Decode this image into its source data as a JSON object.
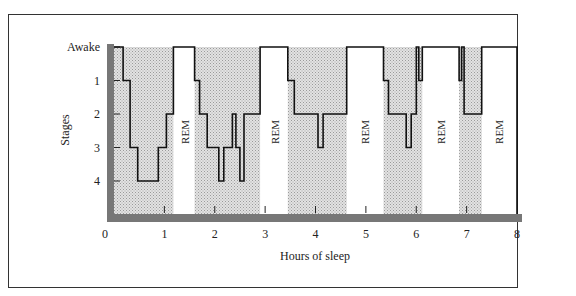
{
  "chart_data": {
    "type": "line",
    "subtype": "step",
    "title": "",
    "xlabel": "Hours of sleep",
    "ylabel": "Stages",
    "xlim": [
      0,
      8
    ],
    "x_ticks": [
      "0",
      "1",
      "2",
      "3",
      "4",
      "5",
      "6",
      "7",
      "8"
    ],
    "y_ticks": [
      "Awake",
      "1",
      "2",
      "3",
      "4"
    ],
    "y_encoding": {
      "Awake": 0,
      "1": 1,
      "2": 2,
      "3": 3,
      "4": 4
    },
    "series": [
      {
        "name": "Sleep stage",
        "points": [
          [
            0.18,
            0
          ],
          [
            0.18,
            1
          ],
          [
            0.32,
            1
          ],
          [
            0.32,
            3
          ],
          [
            0.47,
            3
          ],
          [
            0.47,
            4
          ],
          [
            0.88,
            4
          ],
          [
            0.88,
            3
          ],
          [
            1.04,
            3
          ],
          [
            1.04,
            2
          ],
          [
            1.18,
            2
          ],
          [
            1.18,
            0
          ],
          [
            1.6,
            0
          ],
          [
            1.6,
            1
          ],
          [
            1.7,
            1
          ],
          [
            1.7,
            2
          ],
          [
            1.85,
            2
          ],
          [
            1.85,
            3
          ],
          [
            2.08,
            3
          ],
          [
            2.08,
            4
          ],
          [
            2.18,
            4
          ],
          [
            2.18,
            3
          ],
          [
            2.35,
            3
          ],
          [
            2.35,
            2
          ],
          [
            2.42,
            2
          ],
          [
            2.42,
            3
          ],
          [
            2.5,
            3
          ],
          [
            2.5,
            4
          ],
          [
            2.58,
            4
          ],
          [
            2.58,
            2
          ],
          [
            2.9,
            2
          ],
          [
            2.9,
            0
          ],
          [
            3.45,
            0
          ],
          [
            3.45,
            1
          ],
          [
            3.58,
            1
          ],
          [
            3.58,
            2
          ],
          [
            4.05,
            2
          ],
          [
            4.05,
            3
          ],
          [
            4.15,
            3
          ],
          [
            4.15,
            2
          ],
          [
            4.62,
            2
          ],
          [
            4.62,
            0
          ],
          [
            5.35,
            0
          ],
          [
            5.35,
            1
          ],
          [
            5.45,
            1
          ],
          [
            5.45,
            2
          ],
          [
            5.8,
            2
          ],
          [
            5.8,
            3
          ],
          [
            5.9,
            3
          ],
          [
            5.9,
            2
          ],
          [
            6.0,
            2
          ],
          [
            6.0,
            0
          ],
          [
            6.05,
            0
          ],
          [
            6.05,
            1
          ],
          [
            6.12,
            1
          ],
          [
            6.12,
            0
          ],
          [
            6.85,
            0
          ],
          [
            6.85,
            1
          ],
          [
            6.9,
            1
          ],
          [
            6.9,
            0
          ],
          [
            6.95,
            0
          ],
          [
            6.95,
            2
          ],
          [
            7.3,
            2
          ],
          [
            7.3,
            0
          ],
          [
            8.0,
            0
          ],
          [
            8.0,
            5
          ]
        ]
      }
    ],
    "shaded_regions": [
      [
        0,
        1.18
      ],
      [
        1.6,
        2.9
      ],
      [
        3.45,
        4.62
      ],
      [
        5.35,
        6.12
      ],
      [
        6.85,
        7.3
      ]
    ],
    "annotations": [
      {
        "text": "REM",
        "x": 1.4
      },
      {
        "text": "REM",
        "x": 3.2
      },
      {
        "text": "REM",
        "x": 4.98
      },
      {
        "text": "REM",
        "x": 6.5
      },
      {
        "text": "REM",
        "x": 7.65
      }
    ],
    "grid": false,
    "legend": null
  },
  "labels": {
    "xlabel": "Hours of sleep",
    "ylabel": "Stages",
    "rem": "REM",
    "y": [
      "Awake",
      "1",
      "2",
      "3",
      "4"
    ],
    "x": [
      "0",
      "1",
      "2",
      "3",
      "4",
      "5",
      "6",
      "7",
      "8"
    ]
  }
}
